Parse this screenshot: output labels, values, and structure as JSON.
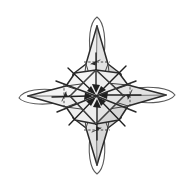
{
  "figure": {
    "title": "Four-pointed origami star fold diagram",
    "kind": "line-art-diagram",
    "caption": "",
    "background_color": "#ffffff",
    "canvas": {
      "width": 191,
      "height": 191
    },
    "center": {
      "x": 95.5,
      "y": 95.5
    }
  },
  "palette": {
    "outline": "#2b2b2b",
    "thin_outline": "#444444",
    "flap_outline": "#5a5a5a",
    "crease": "#555555",
    "dashed_fold": "#3a3a3a",
    "arrow": "#1f1f1f",
    "facet_pale": "#f4f4f4",
    "facet_light": "#eeeeee",
    "facet_mid": "#e3e3e3",
    "facet_dark": "#d6d6d6",
    "paper_white": "#ffffff"
  },
  "points": [
    {
      "name": "north-point",
      "direction": "up",
      "tip_x": 97,
      "tip_y": 17,
      "flap": true
    },
    {
      "name": "east-point",
      "direction": "right",
      "tip_x": 175,
      "tip_y": 95,
      "flap": true
    },
    {
      "name": "south-point",
      "direction": "down",
      "tip_x": 97,
      "tip_y": 174,
      "flap": true
    },
    {
      "name": "west-point",
      "direction": "left",
      "tip_x": 19,
      "tip_y": 98,
      "flap": true
    }
  ],
  "arrows": {
    "count": 8,
    "target": "center",
    "description": "converging fold arrows pointing inward to the center vertex"
  },
  "folds": {
    "dashed_count": 4,
    "description": "dashed valley-fold creases across each arm"
  },
  "labels": {
    "none": ""
  }
}
